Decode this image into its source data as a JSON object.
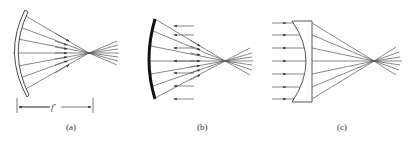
{
  "figure": {
    "panels": [
      {
        "id": "a",
        "label": "(a)",
        "element": "concave-mirror",
        "dimension_label": "f′",
        "description": "Rays reflected by a concave mirror converge to a focal point; focal length marked below."
      },
      {
        "id": "b",
        "label": "(b)",
        "element": "concave-mirror",
        "description": "Parallel incoming rays (arrows pointing left) reflected by a thick concave mirror converge to focus."
      },
      {
        "id": "c",
        "label": "(c)",
        "element": "plano-concave-lens",
        "description": "Parallel rays entering from the left pass through a lens with concave front surface and converge to a focus."
      }
    ]
  }
}
